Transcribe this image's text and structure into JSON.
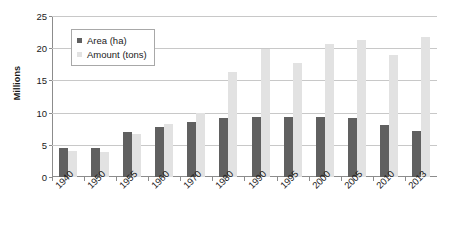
{
  "chart_data": {
    "type": "bar",
    "title": "",
    "xlabel": "",
    "ylabel": "Millions",
    "ylim": [
      0,
      25
    ],
    "yticks": [
      0,
      5,
      10,
      15,
      20,
      25
    ],
    "grid": true,
    "legend_position": "top-left-inside",
    "categories": [
      "1940",
      "1950",
      "1955",
      "1960",
      "1970",
      "1980",
      "1990",
      "1995",
      "2000",
      "2005",
      "2010",
      "2013"
    ],
    "series": [
      {
        "name": "Area (ha)",
        "color": "#606060",
        "values": [
          4.5,
          4.5,
          7.0,
          7.7,
          8.5,
          9.2,
          9.3,
          9.3,
          9.3,
          9.2,
          8.0,
          7.1
        ]
      },
      {
        "name": "Amount (tons)",
        "color": "#e2e2e2",
        "values": [
          4.0,
          3.9,
          6.7,
          8.2,
          10.0,
          16.3,
          19.9,
          17.7,
          20.7,
          21.2,
          19.0,
          21.8
        ]
      }
    ]
  },
  "axis": {
    "y_title": "Millions"
  },
  "legend": {
    "items": [
      {
        "label": "Area (ha)"
      },
      {
        "label": "Amount (tons)"
      }
    ]
  }
}
